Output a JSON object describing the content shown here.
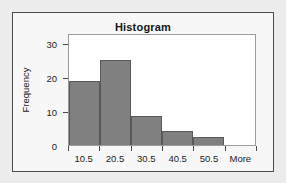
{
  "chart_data": {
    "type": "bar",
    "title": "Histogram",
    "xlabel": "",
    "ylabel": "Frequency",
    "categories": [
      "10.5",
      "20.5",
      "30.5",
      "40.5",
      "50.5",
      "More"
    ],
    "values": [
      19,
      25,
      8.5,
      4,
      2.5,
      0
    ],
    "yticks": [
      0,
      10,
      20,
      30
    ],
    "ylim": [
      0,
      33
    ],
    "grid": false,
    "legend": null,
    "bar_color": "#808080",
    "bar_edge_color": "#595959",
    "plot_background": "#ffffff",
    "panel_background": "#f7f7f7",
    "page_background": "#ececec"
  }
}
